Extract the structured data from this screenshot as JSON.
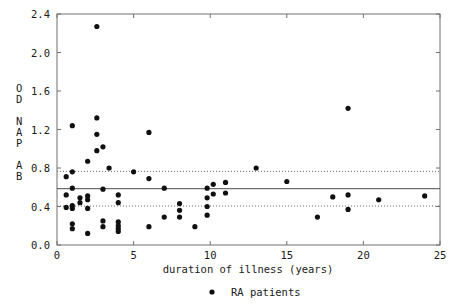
{
  "chart_data": {
    "type": "scatter",
    "title": "",
    "subtitle": "",
    "xlabel": "duration of illness (years)",
    "ylabel": "OD NAP AB",
    "ylabel_lines": [
      "O",
      "D",
      "",
      "N",
      "A",
      "P",
      "",
      "A",
      "B"
    ],
    "xlim": [
      0,
      25
    ],
    "ylim": [
      0.0,
      2.4
    ],
    "xticks": [
      0,
      5,
      10,
      15,
      20,
      25
    ],
    "xtick_labels": [
      "0",
      "5",
      "10",
      "15",
      "20",
      "25"
    ],
    "yticks": [
      0.0,
      0.4,
      0.8,
      1.2,
      1.6,
      2.0,
      2.4
    ],
    "ytick_labels": [
      "0.0",
      "0.4",
      "0.8",
      "1.2",
      "1.6",
      "2.0",
      "2.4"
    ],
    "grid": false,
    "legend_position": "below-axis-center",
    "marker": "filled-circle",
    "marker_color": "#101010",
    "marker_size_px": 2.6,
    "reference_lines": [
      {
        "name": "mean",
        "value": 0.585,
        "style": "solid",
        "color": "#4a4a4a"
      },
      {
        "name": "upper-limit",
        "value": 0.765,
        "style": "dotted",
        "color": "#6a6a6a"
      },
      {
        "name": "lower-limit",
        "value": 0.405,
        "style": "dotted",
        "color": "#6a6a6a"
      }
    ],
    "series": [
      {
        "name": "RA patients",
        "marker": "filled-circle",
        "color": "#101010",
        "points": [
          [
            0.6,
            0.71
          ],
          [
            0.6,
            0.52
          ],
          [
            0.6,
            0.39
          ],
          [
            1.0,
            1.24
          ],
          [
            1.0,
            0.76
          ],
          [
            1.0,
            0.59
          ],
          [
            1.0,
            0.41
          ],
          [
            1.0,
            0.38
          ],
          [
            1.0,
            0.22
          ],
          [
            1.0,
            0.17
          ],
          [
            1.5,
            0.49
          ],
          [
            1.5,
            0.44
          ],
          [
            2.0,
            0.87
          ],
          [
            2.0,
            0.51
          ],
          [
            2.0,
            0.47
          ],
          [
            2.0,
            0.38
          ],
          [
            2.0,
            0.12
          ],
          [
            2.6,
            1.32
          ],
          [
            2.6,
            2.27
          ],
          [
            2.6,
            1.15
          ],
          [
            2.6,
            0.98
          ],
          [
            3.0,
            1.02
          ],
          [
            3.0,
            0.58
          ],
          [
            3.0,
            0.25
          ],
          [
            3.0,
            0.19
          ],
          [
            3.4,
            0.8
          ],
          [
            4.0,
            0.52
          ],
          [
            4.0,
            0.44
          ],
          [
            4.0,
            0.24
          ],
          [
            4.0,
            0.2
          ],
          [
            4.0,
            0.17
          ],
          [
            4.0,
            0.14
          ],
          [
            5.0,
            0.76
          ],
          [
            6.0,
            1.17
          ],
          [
            6.0,
            0.69
          ],
          [
            6.0,
            0.19
          ],
          [
            7.0,
            0.59
          ],
          [
            7.0,
            0.29
          ],
          [
            8.0,
            0.43
          ],
          [
            8.0,
            0.36
          ],
          [
            8.0,
            0.29
          ],
          [
            9.0,
            0.19
          ],
          [
            9.8,
            0.59
          ],
          [
            9.8,
            0.49
          ],
          [
            9.8,
            0.4
          ],
          [
            9.8,
            0.31
          ],
          [
            10.2,
            0.63
          ],
          [
            10.2,
            0.53
          ],
          [
            11.0,
            0.65
          ],
          [
            11.0,
            0.54
          ],
          [
            13.0,
            0.8
          ],
          [
            15.0,
            0.66
          ],
          [
            17.0,
            0.29
          ],
          [
            18.0,
            0.5
          ],
          [
            19.0,
            1.42
          ],
          [
            19.0,
            0.52
          ],
          [
            19.0,
            0.37
          ],
          [
            21.0,
            0.47
          ],
          [
            24.0,
            0.51
          ]
        ]
      }
    ],
    "legend": [
      {
        "label": "RA patients",
        "marker": "filled-circle",
        "color": "#101010"
      }
    ]
  }
}
